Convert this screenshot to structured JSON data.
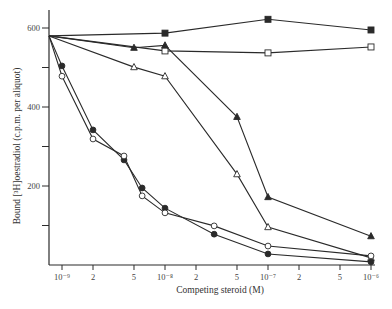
{
  "chart_data": {
    "type": "line",
    "title": "",
    "xlabel": "Competing steroid (M)",
    "ylabel": "Bound [3H]oestradiol (c.p.m. per aliquot)",
    "xscale": "log",
    "xlim": [
      8e-10,
      1e-06
    ],
    "ylim": [
      0,
      640
    ],
    "grid": false,
    "legend": null,
    "x_ticks": [
      {
        "value": 1e-09,
        "label": "10⁻⁹"
      },
      {
        "value": 2e-09,
        "label": "2"
      },
      {
        "value": 5e-09,
        "label": "5"
      },
      {
        "value": 1e-08,
        "label": "10⁻⁸"
      },
      {
        "value": 2e-08,
        "label": "2"
      },
      {
        "value": 5e-08,
        "label": "5"
      },
      {
        "value": 1e-07,
        "label": "10⁻⁷"
      },
      {
        "value": 2e-07,
        "label": "2"
      },
      {
        "value": 5e-07,
        "label": "5"
      },
      {
        "value": 1e-06,
        "label": "10⁻⁶"
      }
    ],
    "y_ticks": [
      {
        "value": 100,
        "label": ""
      },
      {
        "value": 200,
        "label": "200"
      },
      {
        "value": 300,
        "label": ""
      },
      {
        "value": 400,
        "label": "400"
      },
      {
        "value": 500,
        "label": ""
      },
      {
        "value": 600,
        "label": "600"
      }
    ],
    "start_value": 580,
    "series": [
      {
        "name": "filled-square",
        "marker": "square-filled",
        "x": [
          8e-10,
          1e-08,
          1e-07,
          1e-06
        ],
        "values": [
          580,
          587,
          622,
          595
        ]
      },
      {
        "name": "open-square",
        "marker": "square-open",
        "x": [
          8e-10,
          1e-08,
          1e-07,
          1e-06
        ],
        "values": [
          580,
          542,
          537,
          552
        ]
      },
      {
        "name": "filled-triangle",
        "marker": "triangle-filled",
        "x": [
          8e-10,
          5e-09,
          1e-08,
          5e-08,
          1e-07,
          1e-06
        ],
        "values": [
          580,
          550,
          556,
          375,
          172,
          73
        ]
      },
      {
        "name": "open-triangle",
        "marker": "triangle-open",
        "x": [
          8e-10,
          5e-09,
          1e-08,
          5e-08,
          1e-07,
          1e-06
        ],
        "values": [
          580,
          501,
          478,
          230,
          96,
          18
        ]
      },
      {
        "name": "filled-circle",
        "marker": "circle-filled",
        "x": [
          8e-10,
          1e-09,
          2e-09,
          4e-09,
          6e-09,
          1e-08,
          3e-08,
          1e-07,
          1e-06
        ],
        "values": [
          580,
          504,
          342,
          266,
          195,
          144,
          78,
          28,
          8
        ]
      },
      {
        "name": "open-circle",
        "marker": "circle-open",
        "x": [
          8e-10,
          1e-09,
          2e-09,
          4e-09,
          6e-09,
          1e-08,
          3e-08,
          1e-07,
          1e-06
        ],
        "values": [
          580,
          478,
          319,
          276,
          175,
          132,
          99,
          48,
          23
        ]
      }
    ]
  },
  "axes": {
    "x_title": "Competing steroid (M)",
    "y_title": "Bound [³H]oestradiol (c.p.m. per aliquot)"
  },
  "colors": {
    "ink": "#2a2a2a",
    "background": "#ffffff"
  }
}
